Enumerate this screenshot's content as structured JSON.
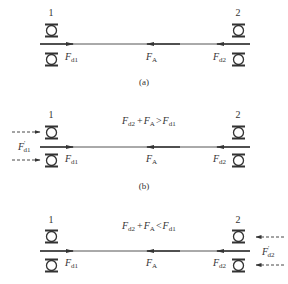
{
  "panels": [
    {
      "id": "a",
      "caption": "(a)",
      "roller_left_label": "1",
      "roller_right_label": "2",
      "forces": [
        {
          "name": "F",
          "sub": "d1",
          "direction": "right"
        },
        {
          "name": "F",
          "sub": "A",
          "direction": "left"
        },
        {
          "name": "F",
          "sub": "d2",
          "direction": "left"
        }
      ],
      "condition": null,
      "external_force": null
    },
    {
      "id": "b",
      "caption": "(b)",
      "roller_left_label": "1",
      "roller_right_label": "2",
      "forces": [
        {
          "name": "F",
          "sub": "d1",
          "direction": "right"
        },
        {
          "name": "F",
          "sub": "A",
          "direction": "left"
        },
        {
          "name": "F",
          "sub": "d2",
          "direction": "left"
        }
      ],
      "condition": {
        "lhs_a": "F",
        "lhs_a_sub": "d2",
        "plus": "+",
        "lhs_b": "F",
        "lhs_b_sub": "A",
        "op": ">",
        "rhs": "F",
        "rhs_sub": "d1"
      },
      "external_force": {
        "name": "F",
        "prime": "'",
        "sub": "d1",
        "side": "left",
        "direction": "right",
        "style": "dashed"
      }
    },
    {
      "id": "c",
      "caption": "",
      "roller_left_label": "1",
      "roller_right_label": "2",
      "forces": [
        {
          "name": "F",
          "sub": "d1",
          "direction": "right"
        },
        {
          "name": "F",
          "sub": "A",
          "direction": "left"
        },
        {
          "name": "F",
          "sub": "d2",
          "direction": "left"
        }
      ],
      "condition": {
        "lhs_a": "F",
        "lhs_a_sub": "d2",
        "plus": "+",
        "lhs_b": "F",
        "lhs_b_sub": "A",
        "op": "<",
        "rhs": "F",
        "rhs_sub": "d1"
      },
      "external_force": {
        "name": "F",
        "prime": "'",
        "sub": "d2",
        "side": "right",
        "direction": "left",
        "style": "dashed"
      }
    }
  ],
  "colors": {
    "line": "#333333",
    "text": "#333333"
  }
}
